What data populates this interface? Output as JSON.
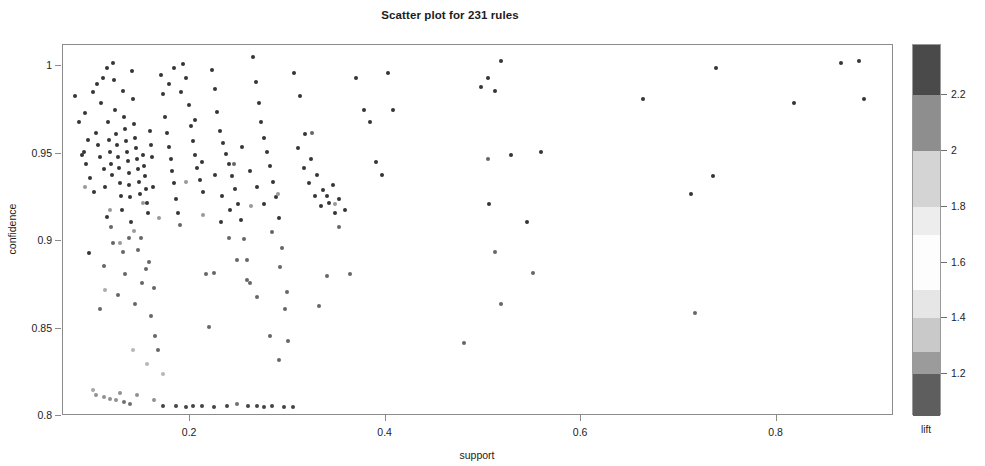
{
  "chart_data": {
    "type": "scatter",
    "title": "Scatter plot for 231 rules",
    "xlabel": "support",
    "ylabel": "confidence",
    "xlim": [
      0.07,
      0.92
    ],
    "ylim": [
      0.8,
      1.012
    ],
    "grid": false,
    "n_rules": 231,
    "xticks": [
      0.2,
      0.4,
      0.6,
      0.8
    ],
    "xtick_labels": [
      "0.2",
      "0.4",
      "0.6",
      "0.8"
    ],
    "yticks": [
      0.8,
      0.85,
      0.9,
      0.95,
      1.0
    ],
    "ytick_labels": [
      "0.8",
      "0.85",
      "0.9",
      "0.95",
      "1"
    ],
    "marker": "filled-circle",
    "marker_size_px": 4,
    "colorbar": {
      "label": "lift",
      "position": "right",
      "orientation": "vertical",
      "ticks": [
        1.2,
        1.4,
        1.6,
        1.8,
        2.0,
        2.2
      ],
      "tick_labels": [
        "1.2",
        "1.4",
        "1.6",
        "1.8",
        "2",
        "2.2"
      ],
      "range": [
        1.05,
        2.38
      ],
      "bands": [
        {
          "from": 2.2,
          "to": 2.38,
          "color": "#4a4a4a"
        },
        {
          "from": 2.0,
          "to": 2.2,
          "color": "#8e8e8e"
        },
        {
          "from": 1.8,
          "to": 2.0,
          "color": "#d4d4d4"
        },
        {
          "from": 1.7,
          "to": 1.8,
          "color": "#ededed"
        },
        {
          "from": 1.5,
          "to": 1.7,
          "color": "#fdfdfd"
        },
        {
          "from": 1.4,
          "to": 1.5,
          "color": "#e6e6e6"
        },
        {
          "from": 1.28,
          "to": 1.4,
          "color": "#c9c9c9"
        },
        {
          "from": 1.2,
          "to": 1.28,
          "color": "#9b9b9b"
        },
        {
          "from": 1.05,
          "to": 1.2,
          "color": "#5e5e5e"
        }
      ]
    },
    "series_name": "association rules",
    "color_by": "lift",
    "points": [
      [
        0.082,
        0.983,
        2.28
      ],
      [
        0.091,
        0.951,
        2.27
      ],
      [
        0.094,
        0.944,
        2.26
      ],
      [
        0.097,
        0.893,
        2.25
      ],
      [
        0.101,
        0.985,
        2.3
      ],
      [
        0.104,
        0.962,
        2.27
      ],
      [
        0.106,
        0.955,
        2.26
      ],
      [
        0.108,
        0.948,
        2.25
      ],
      [
        0.109,
        0.979,
        2.29
      ],
      [
        0.111,
        0.993,
        2.31
      ],
      [
        0.112,
        0.941,
        2.24
      ],
      [
        0.113,
        0.931,
        2.23
      ],
      [
        0.115,
        0.999,
        2.32
      ],
      [
        0.116,
        0.968,
        2.28
      ],
      [
        0.117,
        0.958,
        2.27
      ],
      [
        0.118,
        0.951,
        2.26
      ],
      [
        0.119,
        0.944,
        2.25
      ],
      [
        0.12,
        0.938,
        2.24
      ],
      [
        0.121,
        1.002,
        2.33
      ],
      [
        0.122,
        0.992,
        2.31
      ],
      [
        0.123,
        0.975,
        2.29
      ],
      [
        0.124,
        0.961,
        2.27
      ],
      [
        0.125,
        0.955,
        2.26
      ],
      [
        0.126,
        0.948,
        2.25
      ],
      [
        0.127,
        0.942,
        2.24
      ],
      [
        0.128,
        0.933,
        2.23
      ],
      [
        0.129,
        0.926,
        2.22
      ],
      [
        0.13,
        0.918,
        2.21
      ],
      [
        0.131,
        0.986,
        2.3
      ],
      [
        0.132,
        0.971,
        2.28
      ],
      [
        0.133,
        0.964,
        2.27
      ],
      [
        0.134,
        0.957,
        2.26
      ],
      [
        0.135,
        0.951,
        2.25
      ],
      [
        0.136,
        0.946,
        2.25
      ],
      [
        0.137,
        0.939,
        2.24
      ],
      [
        0.138,
        0.932,
        2.23
      ],
      [
        0.139,
        0.925,
        2.22
      ],
      [
        0.14,
        0.911,
        2.2
      ],
      [
        0.141,
        0.997,
        2.32
      ],
      [
        0.142,
        0.981,
        2.3
      ],
      [
        0.143,
        0.967,
        2.28
      ],
      [
        0.144,
        0.959,
        2.27
      ],
      [
        0.145,
        0.953,
        2.26
      ],
      [
        0.146,
        0.947,
        2.25
      ],
      [
        0.147,
        0.941,
        2.24
      ],
      [
        0.148,
        0.934,
        2.23
      ],
      [
        0.149,
        0.927,
        2.22
      ],
      [
        0.15,
        0.902,
        2.19
      ],
      [
        0.151,
        0.876,
        2.16
      ],
      [
        0.152,
        0.949,
        2.25
      ],
      [
        0.153,
        0.943,
        2.24
      ],
      [
        0.154,
        0.937,
        2.23
      ],
      [
        0.155,
        0.93,
        2.22
      ],
      [
        0.156,
        0.922,
        2.21
      ],
      [
        0.157,
        0.916,
        2.2
      ],
      [
        0.158,
        0.888,
        2.17
      ],
      [
        0.159,
        0.963,
        2.27
      ],
      [
        0.16,
        0.955,
        2.26
      ],
      [
        0.161,
        0.948,
        2.25
      ],
      [
        0.162,
        0.931,
        2.23
      ],
      [
        0.163,
        0.873,
        2.15
      ],
      [
        0.164,
        0.846,
        2.12
      ],
      [
        0.112,
        0.886,
        2.17
      ],
      [
        0.108,
        0.861,
        2.14
      ],
      [
        0.126,
        0.869,
        2.15
      ],
      [
        0.133,
        0.881,
        2.16
      ],
      [
        0.144,
        0.864,
        2.14
      ],
      [
        0.119,
        0.908,
        2.19
      ],
      [
        0.102,
        0.928,
        2.22
      ],
      [
        0.098,
        0.936,
        2.23
      ],
      [
        0.096,
        0.958,
        2.26
      ],
      [
        0.089,
        0.949,
        2.25
      ],
      [
        0.086,
        0.968,
        2.28
      ],
      [
        0.093,
        0.973,
        2.29
      ],
      [
        0.105,
        0.99,
        2.31
      ],
      [
        0.115,
        0.914,
        2.2
      ],
      [
        0.121,
        0.899,
        2.18
      ],
      [
        0.131,
        0.894,
        2.18
      ],
      [
        0.138,
        0.902,
        2.19
      ],
      [
        0.147,
        0.895,
        2.18
      ],
      [
        0.155,
        0.884,
        2.17
      ],
      [
        0.16,
        0.857,
        2.13
      ],
      [
        0.167,
        0.838,
        2.1
      ],
      [
        0.17,
        0.995,
        2.32
      ],
      [
        0.172,
        0.984,
        2.3
      ],
      [
        0.174,
        0.971,
        2.28
      ],
      [
        0.176,
        0.962,
        2.27
      ],
      [
        0.178,
        0.954,
        2.26
      ],
      [
        0.18,
        0.947,
        2.25
      ],
      [
        0.182,
        0.94,
        2.24
      ],
      [
        0.184,
        0.933,
        2.23
      ],
      [
        0.186,
        0.924,
        2.22
      ],
      [
        0.188,
        0.916,
        2.2
      ],
      [
        0.19,
        0.909,
        2.19
      ],
      [
        0.193,
        1.001,
        2.33
      ],
      [
        0.196,
        0.993,
        2.31
      ],
      [
        0.199,
        0.978,
        2.29
      ],
      [
        0.201,
        0.966,
        2.28
      ],
      [
        0.203,
        0.957,
        2.26
      ],
      [
        0.205,
        0.949,
        2.25
      ],
      [
        0.207,
        0.942,
        2.24
      ],
      [
        0.21,
        0.935,
        2.23
      ],
      [
        0.213,
        0.928,
        2.22
      ],
      [
        0.216,
        0.881,
        2.16
      ],
      [
        0.219,
        0.851,
        2.12
      ],
      [
        0.222,
        0.998,
        2.32
      ],
      [
        0.225,
        0.987,
        2.3
      ],
      [
        0.228,
        0.974,
        2.29
      ],
      [
        0.231,
        0.963,
        2.27
      ],
      [
        0.234,
        0.956,
        2.26
      ],
      [
        0.237,
        0.95,
        2.25
      ],
      [
        0.24,
        0.944,
        2.24
      ],
      [
        0.243,
        0.937,
        2.23
      ],
      [
        0.246,
        0.93,
        2.22
      ],
      [
        0.249,
        0.921,
        2.21
      ],
      [
        0.252,
        0.912,
        2.2
      ],
      [
        0.255,
        0.901,
        2.19
      ],
      [
        0.258,
        0.889,
        2.17
      ],
      [
        0.261,
        0.876,
        2.15
      ],
      [
        0.264,
        1.005,
        2.34
      ],
      [
        0.267,
        0.991,
        2.31
      ],
      [
        0.27,
        0.979,
        2.29
      ],
      [
        0.273,
        0.968,
        2.28
      ],
      [
        0.276,
        0.959,
        2.26
      ],
      [
        0.279,
        0.951,
        2.25
      ],
      [
        0.282,
        0.943,
        2.24
      ],
      [
        0.285,
        0.934,
        2.23
      ],
      [
        0.288,
        0.925,
        2.22
      ],
      [
        0.291,
        0.913,
        2.2
      ],
      [
        0.294,
        0.896,
        2.18
      ],
      [
        0.297,
        0.861,
        2.13
      ],
      [
        0.3,
        0.843,
        2.11
      ],
      [
        0.178,
        0.99,
        2.31
      ],
      [
        0.184,
        0.999,
        2.32
      ],
      [
        0.191,
        0.985,
        2.3
      ],
      [
        0.205,
        0.969,
        2.28
      ],
      [
        0.212,
        0.945,
        2.25
      ],
      [
        0.225,
        0.938,
        2.23
      ],
      [
        0.233,
        0.926,
        2.22
      ],
      [
        0.241,
        0.918,
        2.21
      ],
      [
        0.253,
        0.954,
        2.26
      ],
      [
        0.261,
        0.94,
        2.24
      ],
      [
        0.268,
        0.931,
        2.22
      ],
      [
        0.276,
        0.921,
        2.21
      ],
      [
        0.284,
        0.905,
        2.19
      ],
      [
        0.292,
        0.885,
        2.17
      ],
      [
        0.299,
        0.871,
        2.15
      ],
      [
        0.306,
        0.996,
        2.32
      ],
      [
        0.312,
        0.983,
        2.3
      ],
      [
        0.318,
        0.961,
        2.27
      ],
      [
        0.324,
        0.947,
        2.25
      ],
      [
        0.33,
        0.938,
        2.23
      ],
      [
        0.336,
        0.929,
        2.22
      ],
      [
        0.342,
        0.922,
        2.21
      ],
      [
        0.348,
        0.916,
        2.2
      ],
      [
        0.31,
        0.953,
        2.26
      ],
      [
        0.316,
        0.942,
        2.24
      ],
      [
        0.322,
        0.933,
        2.23
      ],
      [
        0.328,
        0.926,
        2.22
      ],
      [
        0.334,
        0.92,
        2.21
      ],
      [
        0.34,
        0.926,
        2.22
      ],
      [
        0.346,
        0.932,
        2.23
      ],
      [
        0.352,
        0.924,
        2.21
      ],
      [
        0.358,
        0.918,
        2.2
      ],
      [
        0.364,
        0.881,
        2.16
      ],
      [
        0.37,
        0.993,
        2.31
      ],
      [
        0.378,
        0.975,
        2.29
      ],
      [
        0.384,
        0.968,
        2.28
      ],
      [
        0.39,
        0.945,
        2.25
      ],
      [
        0.396,
        0.938,
        2.23
      ],
      [
        0.402,
        0.996,
        2.32
      ],
      [
        0.408,
        0.975,
        2.29
      ],
      [
        0.282,
        0.846,
        2.12
      ],
      [
        0.291,
        0.832,
        2.1
      ],
      [
        0.268,
        0.868,
        2.15
      ],
      [
        0.258,
        0.878,
        2.16
      ],
      [
        0.248,
        0.889,
        2.17
      ],
      [
        0.24,
        0.902,
        2.19
      ],
      [
        0.232,
        0.911,
        2.2
      ],
      [
        0.224,
        0.882,
        2.16
      ],
      [
        0.34,
        0.88,
        2.16
      ],
      [
        0.352,
        0.908,
        2.19
      ],
      [
        0.332,
        0.863,
        2.14
      ],
      [
        0.48,
        0.842,
        2.11
      ],
      [
        0.498,
        0.988,
        2.31
      ],
      [
        0.505,
        0.993,
        2.31
      ],
      [
        0.512,
        0.986,
        2.3
      ],
      [
        0.518,
        1.003,
        2.33
      ],
      [
        0.506,
        0.921,
        2.21
      ],
      [
        0.512,
        0.894,
        2.18
      ],
      [
        0.518,
        0.864,
        2.14
      ],
      [
        0.528,
        0.949,
        2.25
      ],
      [
        0.545,
        0.911,
        2.2
      ],
      [
        0.551,
        0.882,
        2.16
      ],
      [
        0.559,
        0.951,
        2.25
      ],
      [
        0.663,
        0.981,
        2.3
      ],
      [
        0.712,
        0.927,
        2.22
      ],
      [
        0.716,
        0.859,
        2.13
      ],
      [
        0.735,
        0.937,
        2.23
      ],
      [
        0.738,
        0.999,
        2.32
      ],
      [
        0.818,
        0.979,
        2.29
      ],
      [
        0.866,
        1.002,
        2.33
      ],
      [
        0.884,
        1.003,
        2.33
      ],
      [
        0.889,
        0.981,
        2.3
      ],
      [
        0.092,
        0.931,
        1.92
      ],
      [
        0.118,
        0.918,
        1.88
      ],
      [
        0.128,
        0.899,
        1.85
      ],
      [
        0.143,
        0.906,
        1.9
      ],
      [
        0.152,
        0.922,
        1.95
      ],
      [
        0.168,
        0.913,
        1.9
      ],
      [
        0.196,
        0.934,
        1.98
      ],
      [
        0.213,
        0.915,
        1.88
      ],
      [
        0.245,
        0.944,
        2.0
      ],
      [
        0.262,
        0.92,
        1.9
      ],
      [
        0.29,
        0.927,
        1.95
      ],
      [
        0.325,
        0.962,
        2.05
      ],
      [
        0.348,
        0.921,
        1.9
      ],
      [
        0.505,
        0.947,
        2.02
      ],
      [
        0.113,
        0.872,
        1.72
      ],
      [
        0.101,
        0.815,
        1.42
      ],
      [
        0.104,
        0.812,
        1.38
      ],
      [
        0.112,
        0.811,
        1.36
      ],
      [
        0.118,
        0.81,
        1.33
      ],
      [
        0.124,
        0.809,
        1.3
      ],
      [
        0.128,
        0.813,
        1.39
      ],
      [
        0.132,
        0.808,
        1.26
      ],
      [
        0.139,
        0.807,
        1.22
      ],
      [
        0.146,
        0.812,
        1.37
      ],
      [
        0.163,
        0.809,
        1.3
      ],
      [
        0.172,
        0.806,
        1.18
      ],
      [
        0.186,
        0.806,
        1.16
      ],
      [
        0.196,
        0.805,
        1.12
      ],
      [
        0.203,
        0.806,
        1.15
      ],
      [
        0.212,
        0.806,
        1.14
      ],
      [
        0.224,
        0.805,
        1.1
      ],
      [
        0.238,
        0.806,
        1.16
      ],
      [
        0.248,
        0.807,
        1.2
      ],
      [
        0.259,
        0.806,
        1.15
      ],
      [
        0.268,
        0.806,
        1.13
      ],
      [
        0.276,
        0.805,
        1.1
      ],
      [
        0.284,
        0.806,
        1.14
      ],
      [
        0.296,
        0.805,
        1.09
      ],
      [
        0.305,
        0.805,
        1.08
      ],
      [
        0.156,
        0.83,
        1.55
      ],
      [
        0.172,
        0.824,
        1.5
      ],
      [
        0.142,
        0.838,
        1.6
      ]
    ]
  }
}
